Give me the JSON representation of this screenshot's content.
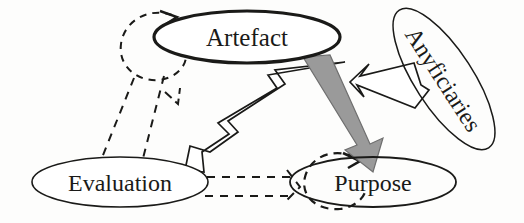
{
  "diagram": {
    "background_color": "#fdfdfc",
    "stroke_color": "#1a1a18",
    "gray_fill_color": "#9a9a9a",
    "white_fill_color": "#ffffff",
    "nodes": [
      {
        "id": "artefact",
        "label": "Artefact",
        "shape": "ellipse",
        "cx": 247,
        "cy": 37,
        "rx": 93,
        "ry": 26,
        "rotation": 0,
        "stroke_width": 3.2,
        "font_size": 25
      },
      {
        "id": "anyficiaries",
        "label": "Anyficiaries",
        "shape": "ellipse",
        "cx": 444,
        "cy": 79,
        "rx": 82,
        "ry": 29,
        "rotation": 57,
        "stroke_width": 1.5,
        "font_size": 24
      },
      {
        "id": "evaluation",
        "label": "Evaluation",
        "shape": "ellipse",
        "cx": 120,
        "cy": 182,
        "rx": 88,
        "ry": 25,
        "rotation": 0,
        "stroke_width": 1.6,
        "font_size": 24
      },
      {
        "id": "purpose",
        "label": "Purpose",
        "shape": "ellipse",
        "cx": 373,
        "cy": 182,
        "rx": 83,
        "ry": 25,
        "rotation": 0,
        "stroke_width": 1.8,
        "font_size": 24
      }
    ],
    "edges": [
      {
        "id": "artefact-to-purpose",
        "from": "artefact",
        "to": "purpose",
        "style": "solid-block-arrow",
        "fill": "#9a9a9a",
        "description": "thick grey block arrow from Artefact down-right into Purpose"
      },
      {
        "id": "evaluation-to-artefact",
        "from": "evaluation",
        "to": "artefact",
        "style": "hollow-block-arrow",
        "fill": "#ffffff",
        "description": "white outlined block arrow from Evaluation up-right into Artefact"
      },
      {
        "id": "anyficiaries-to-artefact",
        "from": "anyficiaries",
        "to": "artefact",
        "style": "hollow-block-arrow",
        "fill": "#ffffff",
        "description": "white outlined block arrow from Anyficiaries left into Artefact"
      },
      {
        "id": "artefact-self-loop",
        "from": "artefact",
        "to": "artefact",
        "style": "dashed-loop",
        "description": "dashed circular self-loop at upper-left of Artefact"
      },
      {
        "id": "artefact-to-evaluation-dashed",
        "from": "artefact",
        "to": "evaluation",
        "style": "dashed-line",
        "description": "two dashed lines descending from the Artefact self-loop to Evaluation"
      },
      {
        "id": "evaluation-to-purpose-dashed",
        "from": "evaluation",
        "to": "purpose",
        "style": "dashed-line",
        "description": "two dashed lines from Evaluation rightwards to the Purpose self-loop"
      },
      {
        "id": "purpose-self-loop",
        "from": "purpose",
        "to": "purpose",
        "style": "dashed-loop",
        "description": "dashed circular self-loop at left of Purpose"
      }
    ]
  }
}
